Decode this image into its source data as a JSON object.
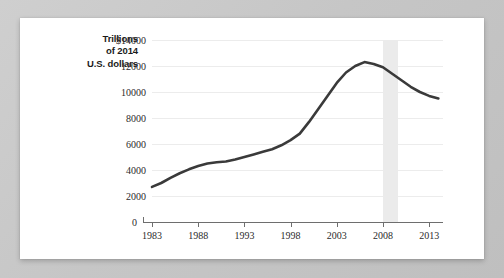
{
  "card": {
    "background_color": "#ffffff",
    "page_background_color": "#c9c9c9"
  },
  "axis_title": {
    "line1": "Trillions",
    "line2": "of 2014",
    "line3": "U.S. dollars"
  },
  "chart_data": {
    "type": "line",
    "title": "",
    "xlabel": "",
    "ylabel": "Trillions of 2014 U.S. dollars",
    "xlim": [
      1983,
      2014.5
    ],
    "ylim": [
      0,
      14000
    ],
    "grid": true,
    "legend": "none",
    "line_color": "#3a3a3a",
    "y_ticks": [
      0,
      2000,
      4000,
      6000,
      8000,
      10000,
      12000,
      14000
    ],
    "y_tick_labels": [
      "0",
      "2000",
      "4000",
      "6000",
      "8000",
      "10000",
      "12000",
      "$14000"
    ],
    "x_ticks": [
      1983,
      1988,
      1993,
      1998,
      2003,
      2008,
      2013
    ],
    "x_tick_labels": [
      "1983",
      "1988",
      "1993",
      "1998",
      "2003",
      "2008",
      "2013"
    ],
    "annotations": [
      {
        "name": "recession-band",
        "type": "vspan",
        "x_start": 2008.0,
        "x_end": 2009.6,
        "color": "#ebebeb"
      }
    ],
    "x": [
      1983,
      1984,
      1985,
      1986,
      1987,
      1988,
      1989,
      1990,
      1991,
      1992,
      1993,
      1994,
      1995,
      1996,
      1997,
      1998,
      1999,
      2000,
      2001,
      2002,
      2003,
      2004,
      2005,
      2006,
      2007,
      2008,
      2009,
      2010,
      2011,
      2012,
      2013,
      2014
    ],
    "values": [
      2700,
      3000,
      3400,
      3750,
      4050,
      4300,
      4500,
      4600,
      4650,
      4800,
      5000,
      5200,
      5400,
      5600,
      5900,
      6300,
      6800,
      7700,
      8700,
      9700,
      10700,
      11500,
      12000,
      12300,
      12150,
      11900,
      11400,
      10900,
      10400,
      10000,
      9700,
      9500
    ]
  }
}
